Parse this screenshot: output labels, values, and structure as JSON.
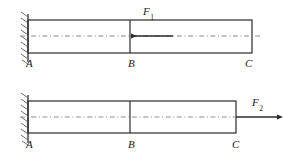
{
  "figure": {
    "width": 283,
    "height": 162,
    "colors": {
      "outline": "#2b2b2b",
      "centerline": "#8c8c8c",
      "hatch": "#6e6e6e",
      "background": "#ffffff",
      "text": "#1a1a1a"
    }
  },
  "diagrams": [
    {
      "id": "upper",
      "name": "bar-with-compressive-load-at-B",
      "support": {
        "type": "fixed-wall",
        "position": "left",
        "hatching": "diagonal"
      },
      "beam": {
        "x1": 28,
        "x2": 252,
        "y_top": 20,
        "y_bottom": 53
      },
      "centerline": {
        "style": "dash-dot",
        "y": 36
      },
      "nodes": [
        {
          "label": "A",
          "x": 28,
          "label_x": 26,
          "label_y": 58
        },
        {
          "label": "B",
          "x": 130,
          "label_x": 128,
          "label_y": 58
        },
        {
          "label": "C",
          "x": 252,
          "label_x": 245,
          "label_y": 58
        }
      ],
      "load": {
        "label": "F",
        "subscript": "1",
        "direction": "left",
        "sense": "compression",
        "applied_at": "B",
        "arrow_tip_x": 131,
        "arrow_tail_x": 173,
        "arrow_y": 36,
        "label_x": 143,
        "label_y": 6
      }
    },
    {
      "id": "lower",
      "name": "bar-with-tensile-load-at-C",
      "support": {
        "type": "fixed-wall",
        "position": "left",
        "hatching": "diagonal"
      },
      "beam": {
        "x1": 28,
        "x2": 236,
        "y_top": 101,
        "y_bottom": 133
      },
      "centerline": {
        "style": "dash-dot",
        "y": 117
      },
      "nodes": [
        {
          "label": "A",
          "x": 28,
          "label_x": 26,
          "label_y": 139
        },
        {
          "label": "B",
          "x": 130,
          "label_x": 128,
          "label_y": 139
        },
        {
          "label": "C",
          "x": 236,
          "label_x": 232,
          "label_y": 139
        }
      ],
      "load": {
        "label": "F",
        "subscript": "2",
        "direction": "right",
        "sense": "tension",
        "applied_at": "C",
        "arrow_tip_x": 277,
        "arrow_tail_x": 236,
        "arrow_y": 117,
        "label_x": 252,
        "label_y": 97
      }
    }
  ]
}
